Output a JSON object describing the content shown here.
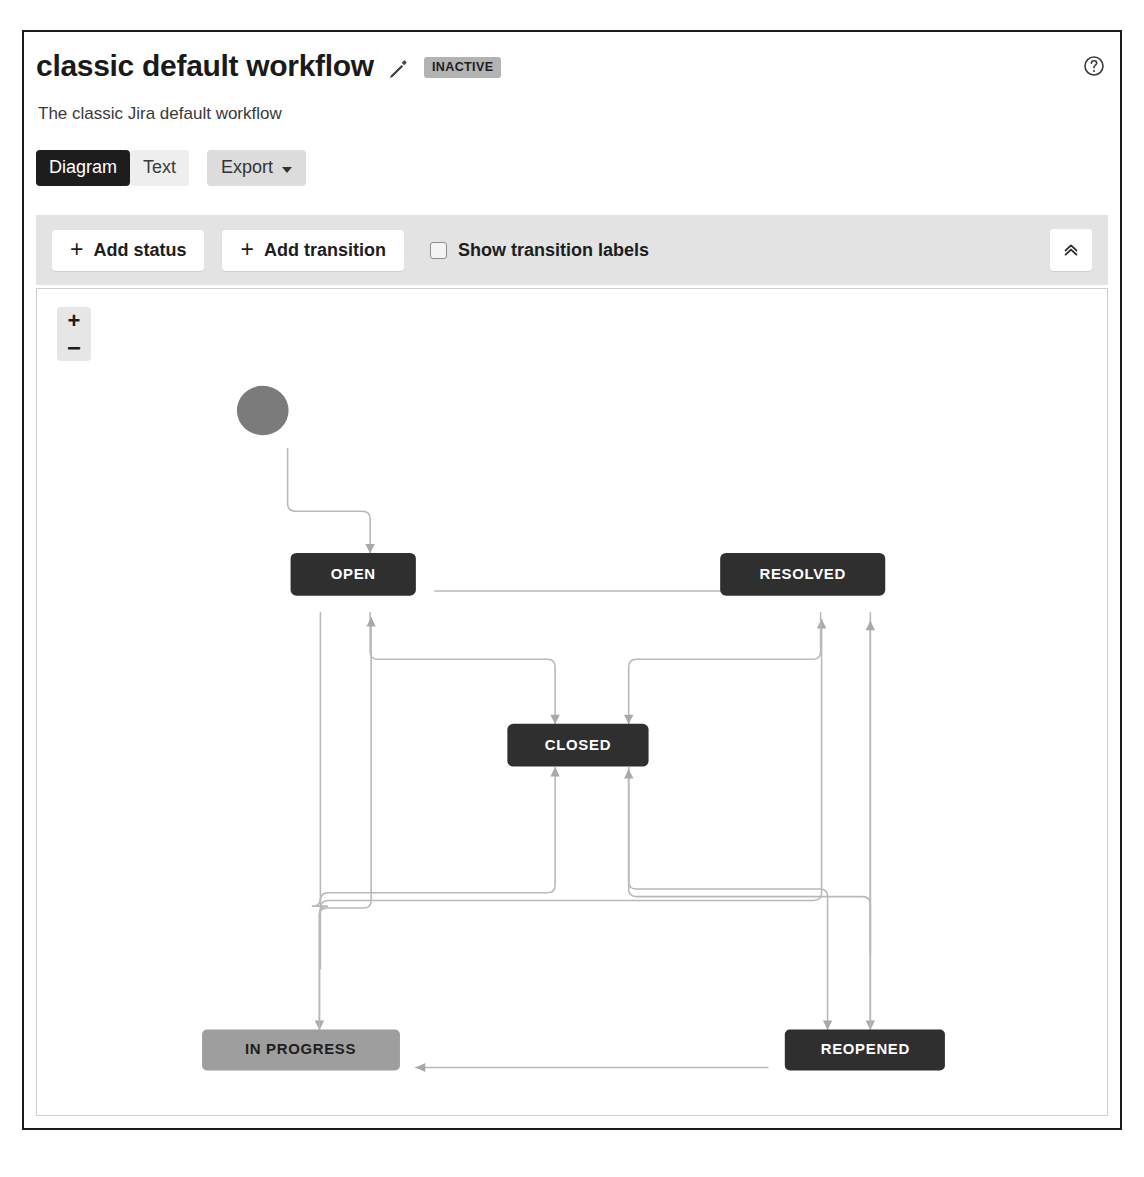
{
  "header": {
    "title": "classic default workflow",
    "edit_icon": "pencil-icon",
    "status_badge": "INACTIVE",
    "help_icon": "question-circle-icon",
    "subtitle": "The classic Jira default workflow"
  },
  "tabs": [
    {
      "label": "Diagram",
      "selected": true
    },
    {
      "label": "Text",
      "selected": false
    }
  ],
  "export": {
    "label": "Export",
    "caret_icon": "chevron-down-icon"
  },
  "toolbar": {
    "add_status_label": "Add status",
    "add_transition_label": "Add transition",
    "plus_icon": "plus-icon",
    "show_labels_checkbox": {
      "label": "Show transition labels",
      "checked": false
    },
    "collapse_icon": "double-chevron-up-icon",
    "collapse_title": "Collapse toolbar"
  },
  "canvas": {
    "zoom_in": "+",
    "zoom_out": "−",
    "zoom_in_name": "zoom-in-button",
    "zoom_out_name": "zoom-out-button"
  },
  "colors": {
    "node_dark": "#2f2f2f",
    "node_gray": "#9e9e9e",
    "start_node": "#777777",
    "edge": "#b4b4b4",
    "toolbar_bg": "#e3e3e3",
    "tab_selected_bg": "#1d1d1d",
    "badge_bg": "#b3b3b3"
  },
  "workflow": {
    "type": "state-diagram",
    "start_node": {
      "name": "start",
      "shape": "circle",
      "cx": 264,
      "cy": 423,
      "r": 25
    },
    "nodes": [
      {
        "id": "open",
        "label": "OPEN",
        "x": 285,
        "y": 552,
        "w": 126,
        "h": 45,
        "style": "dark"
      },
      {
        "id": "resolved",
        "label": "RESOLVED",
        "x": 715,
        "y": 552,
        "w": 166,
        "h": 45,
        "style": "dark"
      },
      {
        "id": "closed",
        "label": "CLOSED",
        "x": 503,
        "y": 731,
        "w": 142,
        "h": 45,
        "style": "dark"
      },
      {
        "id": "in_progress",
        "label": "IN PROGRESS",
        "x": 196,
        "y": 1053,
        "w": 199,
        "h": 43,
        "style": "gray"
      },
      {
        "id": "reopened",
        "label": "REOPENED",
        "x": 780,
        "y": 1053,
        "w": 161,
        "h": 43,
        "style": "dark"
      }
    ],
    "transitions": [
      {
        "from": "start",
        "to": "open"
      },
      {
        "from": "open",
        "to": "resolved"
      },
      {
        "from": "open",
        "to": "closed"
      },
      {
        "from": "open",
        "to": "in_progress"
      },
      {
        "from": "in_progress",
        "to": "open"
      },
      {
        "from": "in_progress",
        "to": "resolved"
      },
      {
        "from": "in_progress",
        "to": "closed"
      },
      {
        "from": "resolved",
        "to": "closed"
      },
      {
        "from": "resolved",
        "to": "reopened"
      },
      {
        "from": "closed",
        "to": "reopened"
      },
      {
        "from": "reopened",
        "to": "resolved"
      },
      {
        "from": "reopened",
        "to": "closed"
      },
      {
        "from": "reopened",
        "to": "in_progress"
      }
    ]
  }
}
